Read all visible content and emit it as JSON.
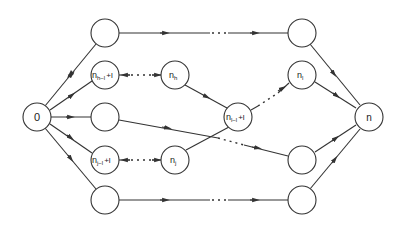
{
  "diagram": {
    "type": "directed-graph",
    "nodes": [
      {
        "id": "src",
        "label": "0",
        "x": 37,
        "y": 117
      },
      {
        "id": "t1",
        "label": "",
        "x": 105,
        "y": 33
      },
      {
        "id": "t2",
        "label": "",
        "x": 302,
        "y": 33
      },
      {
        "id": "h1",
        "label": "n",
        "sub": "h−l",
        "suffix": "+l",
        "x": 105,
        "y": 75
      },
      {
        "id": "h2",
        "label": "n",
        "sub": "h",
        "suffix": "",
        "x": 175,
        "y": 75
      },
      {
        "id": "m1",
        "label": "",
        "x": 105,
        "y": 117
      },
      {
        "id": "mid",
        "label": "n",
        "sub": "l−l",
        "suffix": "+l",
        "x": 238,
        "y": 117
      },
      {
        "id": "l1",
        "label": "n",
        "sub": "l",
        "suffix": "",
        "x": 302,
        "y": 75
      },
      {
        "id": "sink",
        "label": "n",
        "x": 369,
        "y": 117
      },
      {
        "id": "j1",
        "label": "n",
        "sub": "j−l",
        "suffix": "+l",
        "x": 105,
        "y": 160
      },
      {
        "id": "j2",
        "label": "n",
        "sub": "j",
        "suffix": "",
        "x": 175,
        "y": 160
      },
      {
        "id": "r4",
        "label": "",
        "x": 302,
        "y": 160
      },
      {
        "id": "b1",
        "label": "",
        "x": 105,
        "y": 200
      },
      {
        "id": "b2",
        "label": "",
        "x": 302,
        "y": 200
      }
    ],
    "edges": [
      {
        "from": "src",
        "to": "t1",
        "style": "solid"
      },
      {
        "from": "src",
        "to": "h1",
        "style": "solid"
      },
      {
        "from": "src",
        "to": "m1",
        "style": "solid"
      },
      {
        "from": "src",
        "to": "j1",
        "style": "solid"
      },
      {
        "from": "src",
        "to": "b1",
        "style": "solid"
      },
      {
        "from": "t1",
        "to": "t2",
        "style": "dotted-solid"
      },
      {
        "from": "h1",
        "to": "h2",
        "style": "dotted",
        "direction": "backward"
      },
      {
        "from": "h2",
        "to": "mid",
        "style": "solid"
      },
      {
        "from": "j1",
        "to": "j2",
        "style": "dotted",
        "direction": "backward"
      },
      {
        "from": "j2",
        "to": "mid",
        "style": "solid"
      },
      {
        "from": "mid",
        "to": "l1",
        "style": "dotted"
      },
      {
        "from": "m1",
        "to": "r4",
        "style": "solid-dotted"
      },
      {
        "from": "b1",
        "to": "b2",
        "style": "dotted-solid"
      },
      {
        "from": "t2",
        "to": "sink",
        "style": "solid"
      },
      {
        "from": "l1",
        "to": "sink",
        "style": "solid"
      },
      {
        "from": "r4",
        "to": "sink",
        "style": "solid"
      },
      {
        "from": "b2",
        "to": "sink",
        "style": "solid"
      }
    ]
  },
  "labels": {
    "src": "0",
    "h1_main": "n",
    "h1_sub": "h−l",
    "h1_suffix": "+l",
    "h2_main": "n",
    "h2_sub": "h",
    "mid_main": "n",
    "mid_sub": "l−l",
    "mid_suffix": "+l",
    "l1_main": "n",
    "l1_sub": "l",
    "sink": "n",
    "j1_main": "n",
    "j1_sub": "j−l",
    "j1_suffix": "+l",
    "j2_main": "n",
    "j2_sub": "j"
  }
}
